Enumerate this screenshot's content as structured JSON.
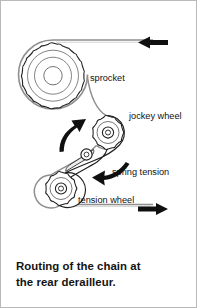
{
  "figure": {
    "caption_lines": [
      "Routing of the chain at",
      "the rear derailleur."
    ],
    "border_color": "#b9b9b9",
    "background_color": "#ffffff",
    "ink_color": "#1a1a1a",
    "chain_color": "#8a8a8a"
  },
  "diagram": {
    "title": "Routing of the chain at the rear derailleur.",
    "labels": {
      "sprocket": "sprocket",
      "jockey_wheel": "jockey wheel",
      "spring_tension": "spring tension",
      "tension_wheel": "tension wheel"
    },
    "components": [
      {
        "name": "sprocket",
        "label": "sprocket",
        "teeth": 18,
        "center_x": 52,
        "center_y": 73,
        "outer_radius": 34
      },
      {
        "name": "jockey-wheel",
        "label": "jockey wheel",
        "teeth": 11,
        "center_x": 107,
        "center_y": 131,
        "outer_radius": 16
      },
      {
        "name": "tension-wheel",
        "label": "tension wheel",
        "teeth": 11,
        "center_x": 60,
        "center_y": 187,
        "outer_radius": 16
      },
      {
        "name": "cage-pivot-bolt",
        "label": "",
        "center_x": 85,
        "center_y": 154,
        "outer_radius": 6
      }
    ],
    "arrows": [
      {
        "name": "chain-direction-top",
        "direction": "left",
        "x": 150,
        "y": 42
      },
      {
        "name": "chain-direction-bottom",
        "direction": "right",
        "x": 150,
        "y": 208
      },
      {
        "name": "cage-rotation",
        "direction": "up-right",
        "x": 70,
        "y": 135
      },
      {
        "name": "spring-tension",
        "direction": "down-left",
        "x": 105,
        "y": 172
      }
    ]
  }
}
